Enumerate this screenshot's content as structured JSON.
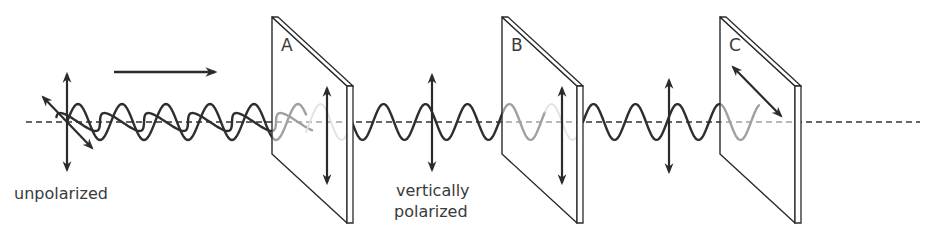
{
  "figure": {
    "colors": {
      "ink": "#2b2b2b",
      "wave_dark": "#2e2e2e",
      "wave_faded": "#bdbdbd",
      "axis": "#333333",
      "axis_faded": "#b8b8b8",
      "plate_fill": "#ffffff",
      "text": "#3a3a3a"
    },
    "axis": {
      "y": 122,
      "x_start": 26,
      "x_end": 920
    },
    "direction_arrow": {
      "x1": 114,
      "x2": 217,
      "y": 72,
      "meaning": "direction of travel"
    },
    "filters": [
      {
        "id": "A",
        "label": "A",
        "left_x": 272,
        "right_x": 347,
        "thickness": 6,
        "top_y": 17,
        "axis_orientation": "vertical",
        "arrow": {
          "x": 327,
          "y1": 88,
          "y2": 183
        }
      },
      {
        "id": "B",
        "label": "B",
        "left_x": 502,
        "right_x": 577,
        "thickness": 6,
        "top_y": 17,
        "axis_orientation": "vertical",
        "arrow": {
          "x": 562,
          "y1": 88,
          "y2": 183
        }
      },
      {
        "id": "C",
        "label": "C",
        "left_x": 720,
        "right_x": 795,
        "thickness": 6,
        "top_y": 17,
        "axis_orientation": "diagonal",
        "arrow": {
          "x1": 733,
          "y1": 67,
          "x2": 781,
          "y2": 116
        }
      }
    ],
    "vibration_arrows": [
      {
        "name": "unpolarized-vertical",
        "x1": 67,
        "y1": 74,
        "x2": 67,
        "y2": 170
      },
      {
        "name": "unpolarized-diagonal",
        "x1": 43,
        "y1": 97,
        "x2": 92,
        "y2": 148
      },
      {
        "name": "polarized-after-a",
        "x1": 432,
        "y1": 75,
        "x2": 432,
        "y2": 170
      },
      {
        "name": "polarized-after-b",
        "x1": 669,
        "y1": 80,
        "x2": 669,
        "y2": 172
      }
    ],
    "waves": [
      {
        "name": "unpolarized-vertical-wave",
        "type": "vertical",
        "x_start": 67,
        "x_end": 306,
        "wavelength": 44,
        "amplitude": 18,
        "phase_start_x": 67,
        "color": "dark"
      },
      {
        "name": "unpolarized-diagonal-wave",
        "type": "diagonal",
        "x_start": 60,
        "x_end": 306,
        "wavelength": 44,
        "amplitude": 12,
        "phase_start_x": 56,
        "color": "dark"
      },
      {
        "name": "faded-wave-in-a",
        "type": "vertical",
        "x_start": 306,
        "x_end": 347,
        "wavelength": 42,
        "amplitude": 18,
        "phase_start_x": 310,
        "color": "faded"
      },
      {
        "name": "vertical-wave-a-to-b",
        "type": "vertical",
        "x_start": 352,
        "x_end": 545,
        "wavelength": 42,
        "amplitude": 18,
        "phase_start_x": 373,
        "color": "dark"
      },
      {
        "name": "faded-wave-in-b",
        "type": "vertical",
        "x_start": 545,
        "x_end": 578,
        "wavelength": 42,
        "amplitude": 18,
        "phase_start_x": 541,
        "color": "faded"
      },
      {
        "name": "vertical-wave-b-to-c",
        "type": "vertical",
        "x_start": 583,
        "x_end": 759,
        "wavelength": 42,
        "amplitude": 18,
        "phase_start_x": 583,
        "color": "dark"
      }
    ],
    "captions": {
      "unpolarized": "unpolarized",
      "vertically": "vertically",
      "polarized": "polarized"
    },
    "caption_positions": {
      "unpolarized": {
        "x": 14,
        "y": 199
      },
      "vertically": {
        "x": 396,
        "y": 196
      },
      "polarized": {
        "x": 394,
        "y": 217
      }
    }
  }
}
